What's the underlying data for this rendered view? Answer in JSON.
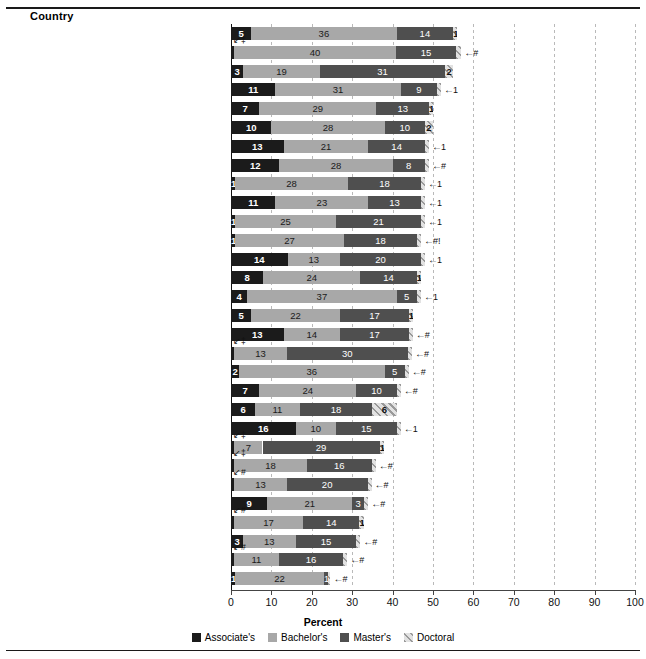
{
  "header": {
    "country_label": "Country"
  },
  "axis": {
    "xlabel": "Percent",
    "ticks": [
      "0",
      "10",
      "20",
      "30",
      "40",
      "50",
      "60",
      "70",
      "80",
      "90",
      "100"
    ],
    "xlim": [
      0,
      100
    ]
  },
  "legend": {
    "items": [
      {
        "label": "Associate's",
        "key": "assoc",
        "color": "#1b1b1b"
      },
      {
        "label": "Bachelor's",
        "key": "bach",
        "color": "#a8a8a8"
      },
      {
        "label": "Master's",
        "key": "mast",
        "color": "#4f4f4f"
      },
      {
        "label": "Doctoral",
        "key": "doct",
        "color": "#9a9a9a"
      }
    ]
  },
  "chart_data": {
    "type": "bar",
    "title": "",
    "subtype": "stacked-horizontal",
    "xlabel": "Percent",
    "ylabel": "Country",
    "xlim": [
      0,
      100
    ],
    "grid": true,
    "legend_position": "bottom",
    "series_names": [
      "Associate's",
      "Bachelor's",
      "Master's",
      "Doctoral"
    ],
    "categories": [
      "Ireland",
      "Lithuania",
      "Luxembourg",
      "Australia",
      "United Kingdom",
      "United States",
      "Norway",
      "Israel",
      "Netherlands",
      "Sweden",
      "Belgium",
      "Iceland",
      "France",
      "OECD average",
      "New Zealand",
      "Denmark",
      "Spain",
      "Poland",
      "Greece",
      "Latvia",
      "Slovenia",
      "Austria",
      "Slovak Republic",
      "Portugal",
      "Czech Republic",
      "Turkey",
      "Germany",
      "Hungary",
      "Italy",
      "Mexico"
    ],
    "rows": [
      {
        "country": "Ireland",
        "label": "Ireland",
        "bold": false,
        "premark": "",
        "assoc": 5,
        "bach": 36,
        "mast": 14,
        "doct": 1,
        "assoc_lbl": "5",
        "bach_lbl": "36",
        "mast_lbl": "14",
        "doct_lbl": "1",
        "endmark": ""
      },
      {
        "country": "Lithuania",
        "label": "Lithuania",
        "bold": false,
        "premark": "‡",
        "assoc": 0.8,
        "bach": 40,
        "mast": 15,
        "doct": 1.2,
        "assoc_lbl": "",
        "bach_lbl": "40",
        "mast_lbl": "15",
        "doct_lbl": "",
        "endmark": "#"
      },
      {
        "country": "Luxembourg",
        "label": "Luxembourg",
        "bold": false,
        "premark": "",
        "assoc": 3,
        "bach": 19,
        "mast": 31,
        "doct": 2,
        "assoc_lbl": "3",
        "bach_lbl": "19",
        "mast_lbl": "31",
        "doct_lbl": "2",
        "endmark": ""
      },
      {
        "country": "Australia",
        "label": "Australia",
        "bold": false,
        "premark": "",
        "assoc": 11,
        "bach": 31,
        "mast": 9,
        "doct": 1,
        "assoc_lbl": "11",
        "bach_lbl": "31",
        "mast_lbl": "9",
        "doct_lbl": "",
        "endmark": "1"
      },
      {
        "country": "United Kingdom",
        "label": "United Kingdom",
        "bold": false,
        "premark": "",
        "assoc": 7,
        "bach": 29,
        "mast": 13,
        "doct": 1,
        "assoc_lbl": "7",
        "bach_lbl": "29",
        "mast_lbl": "13",
        "doct_lbl": "1",
        "endmark": ""
      },
      {
        "country": "United States",
        "label": "United States",
        "bold": true,
        "premark": "",
        "assoc": 10,
        "bach": 28,
        "mast": 10,
        "doct": 2,
        "assoc_lbl": "10",
        "bach_lbl": "28",
        "mast_lbl": "10",
        "doct_lbl": "2",
        "endmark": ""
      },
      {
        "country": "Norway",
        "label": "Norway",
        "bold": false,
        "premark": "",
        "assoc": 13,
        "bach": 21,
        "mast": 14,
        "doct": 1,
        "assoc_lbl": "13",
        "bach_lbl": "21",
        "mast_lbl": "14",
        "doct_lbl": "",
        "endmark": "1"
      },
      {
        "country": "Israel",
        "label": "Israel",
        "bold": false,
        "premark": "",
        "assoc": 12,
        "bach": 28,
        "mast": 8,
        "doct": 1,
        "assoc_lbl": "12",
        "bach_lbl": "28",
        "mast_lbl": "8",
        "doct_lbl": "",
        "endmark": "#"
      },
      {
        "country": "Netherlands",
        "label": "Netherlands",
        "bold": false,
        "premark": "",
        "assoc": 1,
        "bach": 28,
        "mast": 18,
        "doct": 1,
        "assoc_lbl": "1",
        "bach_lbl": "28",
        "mast_lbl": "18",
        "doct_lbl": "",
        "endmark": "1"
      },
      {
        "country": "Sweden",
        "label": "Sweden",
        "bold": false,
        "premark": "",
        "assoc": 11,
        "bach": 23,
        "mast": 13,
        "doct": 1,
        "assoc_lbl": "11",
        "bach_lbl": "23",
        "mast_lbl": "13",
        "doct_lbl": "",
        "endmark": "1"
      },
      {
        "country": "Belgium",
        "label": "Belgium",
        "bold": false,
        "premark": "",
        "assoc": 1,
        "bach": 25,
        "mast": 21,
        "doct": 1,
        "assoc_lbl": "1",
        "bach_lbl": "25",
        "mast_lbl": "21",
        "doct_lbl": "",
        "endmark": "1"
      },
      {
        "country": "Iceland",
        "label": "Iceland",
        "bold": false,
        "premark": "",
        "assoc": 1,
        "bach": 27,
        "mast": 18,
        "doct": 1,
        "assoc_lbl": "1",
        "bach_lbl": "27",
        "mast_lbl": "18",
        "doct_lbl": "",
        "endmark": "#!"
      },
      {
        "country": "France",
        "label": "France",
        "bold": false,
        "premark": "",
        "assoc": 14,
        "bach": 13,
        "mast": 20,
        "doct": 1,
        "assoc_lbl": "14",
        "bach_lbl": "13",
        "mast_lbl": "20",
        "doct_lbl": "",
        "endmark": "1"
      },
      {
        "country": "OECD average",
        "label": "OECD average",
        "bold": true,
        "premark": "",
        "footnote": "1",
        "assoc": 8,
        "bach": 24,
        "mast": 14,
        "doct": 1,
        "assoc_lbl": "8",
        "bach_lbl": "24",
        "mast_lbl": "14",
        "doct_lbl": "1",
        "endmark": ""
      },
      {
        "country": "New Zealand",
        "label": "New Zealand",
        "bold": false,
        "premark": "",
        "assoc": 4,
        "bach": 37,
        "mast": 5,
        "doct": 1,
        "assoc_lbl": "4",
        "bach_lbl": "37",
        "mast_lbl": "5",
        "doct_lbl": "",
        "endmark": "1"
      },
      {
        "country": "Denmark",
        "label": "Denmark",
        "bold": false,
        "premark": "",
        "assoc": 5,
        "bach": 22,
        "mast": 17,
        "doct": 1,
        "assoc_lbl": "5",
        "bach_lbl": "22",
        "mast_lbl": "17",
        "doct_lbl": "1",
        "endmark": ""
      },
      {
        "country": "Spain",
        "label": "Spain",
        "bold": false,
        "premark": "",
        "assoc": 13,
        "bach": 14,
        "mast": 17,
        "doct": 1,
        "assoc_lbl": "13",
        "bach_lbl": "14",
        "mast_lbl": "17",
        "doct_lbl": "",
        "endmark": "#"
      },
      {
        "country": "Poland",
        "label": "Poland",
        "bold": false,
        "premark": "‡",
        "assoc": 0.8,
        "bach": 13,
        "mast": 30,
        "doct": 1,
        "assoc_lbl": "",
        "bach_lbl": "13",
        "mast_lbl": "30",
        "doct_lbl": "",
        "endmark": "#"
      },
      {
        "country": "Greece",
        "label": "Greece",
        "bold": false,
        "premark": "",
        "assoc": 2,
        "bach": 36,
        "mast": 5,
        "doct": 1,
        "assoc_lbl": "2",
        "bach_lbl": "36",
        "mast_lbl": "5",
        "doct_lbl": "",
        "endmark": "#"
      },
      {
        "country": "Latvia",
        "label": "Latvia",
        "bold": false,
        "premark": "",
        "assoc": 7,
        "bach": 24,
        "mast": 10,
        "doct": 1,
        "assoc_lbl": "7",
        "bach_lbl": "24",
        "mast_lbl": "10",
        "doct_lbl": "",
        "endmark": "#"
      },
      {
        "country": "Slovenia",
        "label": "Slovenia",
        "bold": false,
        "premark": "",
        "assoc": 6,
        "bach": 11,
        "mast": 18,
        "doct": 6,
        "assoc_lbl": "6",
        "bach_lbl": "11",
        "mast_lbl": "18",
        "doct_lbl": "6",
        "endmark": ""
      },
      {
        "country": "Austria",
        "label": "Austria",
        "bold": false,
        "premark": "",
        "assoc": 16,
        "bach": 10,
        "mast": 15,
        "doct": 1,
        "assoc_lbl": "16",
        "bach_lbl": "10",
        "mast_lbl": "15",
        "doct_lbl": "",
        "endmark": "1"
      },
      {
        "country": "Slovak Republic",
        "label": "Slovak Republic",
        "bold": false,
        "premark": "‡",
        "assoc": 0.8,
        "bach": 7,
        "mast": 29,
        "doct": 1,
        "assoc_lbl": "",
        "bach_lbl": "7",
        "mast_lbl": "29",
        "doct_lbl": "1",
        "endmark": ""
      },
      {
        "country": "Portugal",
        "label": "Portugal",
        "bold": false,
        "premark": "‡",
        "assoc": 0.8,
        "bach": 18,
        "mast": 16,
        "doct": 1,
        "assoc_lbl": "",
        "bach_lbl": "18",
        "mast_lbl": "16",
        "doct_lbl": "",
        "endmark": "#"
      },
      {
        "country": "Czech Republic",
        "label": "Czech Republic",
        "bold": false,
        "premark": "#",
        "assoc": 0.8,
        "bach": 13,
        "mast": 20,
        "doct": 1,
        "assoc_lbl": "",
        "bach_lbl": "13",
        "mast_lbl": "20",
        "doct_lbl": "",
        "endmark": "#"
      },
      {
        "country": "Turkey",
        "label": "Turkey",
        "bold": false,
        "premark": "",
        "assoc": 9,
        "bach": 21,
        "mast": 3,
        "doct": 1,
        "assoc_lbl": "9",
        "bach_lbl": "21",
        "mast_lbl": "3",
        "doct_lbl": "",
        "endmark": "#"
      },
      {
        "country": "Germany",
        "label": "Germany",
        "bold": false,
        "premark": "#",
        "assoc": 0.8,
        "bach": 17,
        "mast": 14,
        "doct": 1,
        "assoc_lbl": "",
        "bach_lbl": "17",
        "mast_lbl": "14",
        "doct_lbl": "1",
        "endmark": ""
      },
      {
        "country": "Hungary",
        "label": "Hungary",
        "bold": false,
        "premark": "",
        "assoc": 3,
        "bach": 13,
        "mast": 15,
        "doct": 1,
        "assoc_lbl": "3",
        "bach_lbl": "13",
        "mast_lbl": "15",
        "doct_lbl": "",
        "endmark": "#"
      },
      {
        "country": "Italy",
        "label": "Italy",
        "bold": false,
        "premark": "#",
        "assoc": 0.8,
        "bach": 11,
        "mast": 16,
        "doct": 1,
        "assoc_lbl": "",
        "bach_lbl": "11",
        "mast_lbl": "16",
        "doct_lbl": "",
        "endmark": "#"
      },
      {
        "country": "Mexico",
        "label": "Mexico",
        "bold": false,
        "premark": "",
        "assoc": 1,
        "bach": 22,
        "mast": 1,
        "doct": 0.6,
        "assoc_lbl": "1",
        "bach_lbl": "22",
        "mast_lbl": "1",
        "doct_lbl": "",
        "endmark": "#"
      }
    ]
  }
}
